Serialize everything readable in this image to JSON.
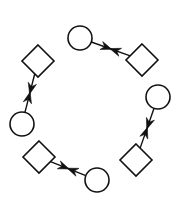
{
  "diagram": {
    "width": 179,
    "height": 202,
    "background": "#ffffff",
    "stroke_color": "#111111",
    "pairs": [
      {
        "id": "pair-top",
        "circle": {
          "cx": 80,
          "cy": 38,
          "r": 12
        },
        "diamond": {
          "cx": 142,
          "cy": 60,
          "half": 16
        }
      },
      {
        "id": "pair-left",
        "circle": {
          "cx": 22,
          "cy": 124,
          "r": 12
        },
        "diamond": {
          "cx": 38,
          "cy": 61,
          "half": 16
        }
      },
      {
        "id": "pair-right",
        "circle": {
          "cx": 158,
          "cy": 97,
          "r": 12
        },
        "diamond": {
          "cx": 136,
          "cy": 160,
          "half": 16
        }
      },
      {
        "id": "pair-bottom",
        "circle": {
          "cx": 97,
          "cy": 180,
          "r": 12
        },
        "diamond": {
          "cx": 39,
          "cy": 157,
          "half": 16
        }
      }
    ]
  }
}
